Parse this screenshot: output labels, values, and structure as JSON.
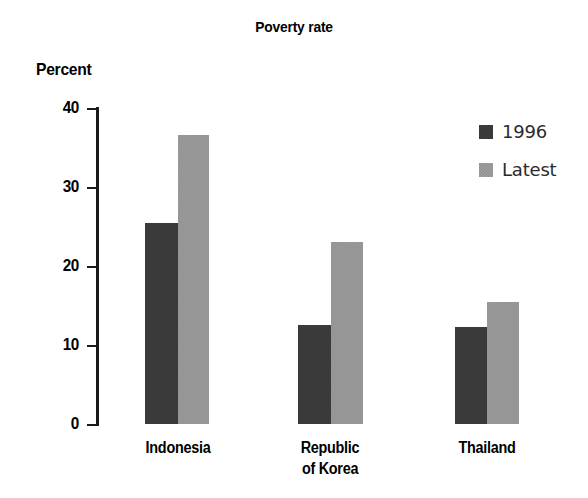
{
  "chart_data": {
    "type": "bar",
    "title": "Poverty rate",
    "ylabel": "Percent",
    "xlabel": "",
    "categories": [
      "Indonesia",
      "Republic of Korea",
      "Thailand"
    ],
    "category_lines": [
      [
        "Indonesia"
      ],
      [
        "Republic",
        "of Korea"
      ],
      [
        "Thailand"
      ]
    ],
    "series": [
      {
        "name": "1996",
        "color": "#3a3a3a",
        "values": [
          25.4,
          12.5,
          12.3
        ]
      },
      {
        "name": "Latest",
        "color": "#8f8f8f",
        "values": [
          36.6,
          23.0,
          15.4
        ]
      }
    ],
    "ylim": [
      0,
      40
    ],
    "yticks": [
      0,
      10,
      20,
      30,
      40
    ],
    "ytick_labels": [
      "0",
      "10",
      "20",
      "30",
      "40"
    ],
    "grid": false,
    "legend_position": "top-right",
    "legend_entries": [
      "1996",
      "Latest"
    ]
  },
  "axis": {
    "tick_40": "40",
    "tick_30": "30",
    "tick_20": "20",
    "tick_10": "10",
    "tick_0": "0"
  },
  "categories": {
    "indonesia_line1": "Indonesia",
    "korea_line1": "Republic",
    "korea_line2": "of Korea",
    "thailand_line1": "Thailand"
  },
  "legend": {
    "item_1996": "1996",
    "item_latest": "Latest"
  },
  "colors": {
    "series_1996": "#3a3a3a",
    "series_latest": "#8f8f8f",
    "axis": "#1a1a1a",
    "text": "#000000",
    "background": "#ffffff"
  }
}
